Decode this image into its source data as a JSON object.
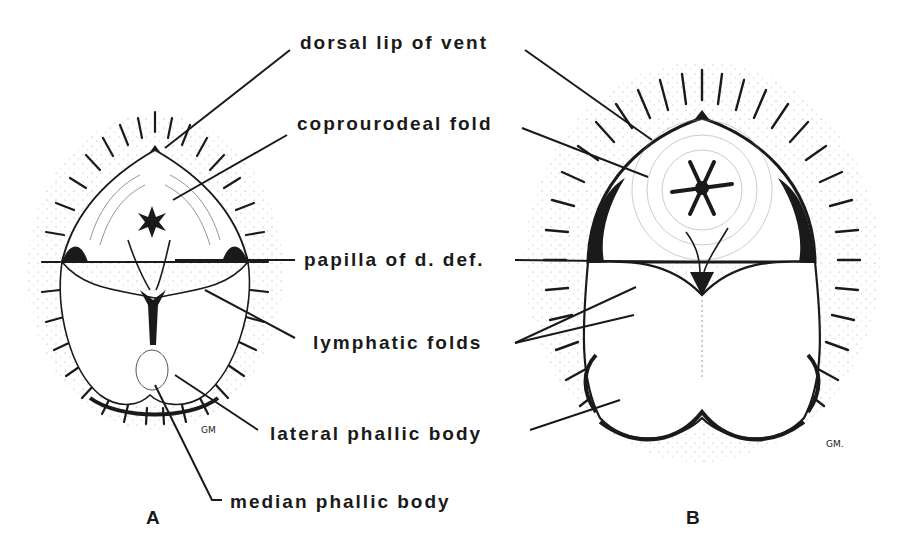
{
  "figure": {
    "panels": [
      {
        "id": "A",
        "letter": "A",
        "signature": "GM"
      },
      {
        "id": "B",
        "letter": "B",
        "signature": "GM."
      }
    ],
    "labels": {
      "dorsal_lip": "dorsal lip of vent",
      "coprourodeal_fold": "coprourodeal fold",
      "papilla": "papilla of d. def.",
      "lymphatic_folds": "lymphatic folds",
      "lateral_phallic_body": "lateral phallic body",
      "median_phallic_body": "median phallic body"
    },
    "colors": {
      "ink": "#1a1a1a",
      "background": "#ffffff"
    }
  }
}
